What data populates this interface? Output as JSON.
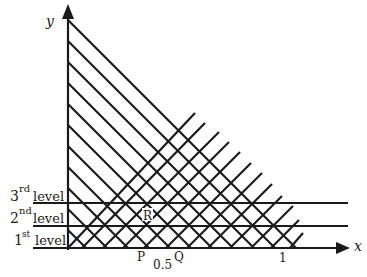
{
  "diagram": {
    "axes": {
      "x_label": "x",
      "y_label": "y"
    },
    "ticks": {
      "half": "0.5",
      "one": "1"
    },
    "points": {
      "P": "P",
      "Q": "Q",
      "R": "R"
    },
    "levels": [
      {
        "num": "3",
        "sup": "rd",
        "word": "level"
      },
      {
        "num": "2",
        "sup": "nd",
        "word": "level"
      },
      {
        "num": "1",
        "sup": "st",
        "word": "level"
      }
    ],
    "line_color": "#1a1a1a",
    "background": "#ffffff",
    "grid": {
      "descending_lines": 11,
      "ascending_lines": 12,
      "horizontal_levels": 2
    }
  }
}
